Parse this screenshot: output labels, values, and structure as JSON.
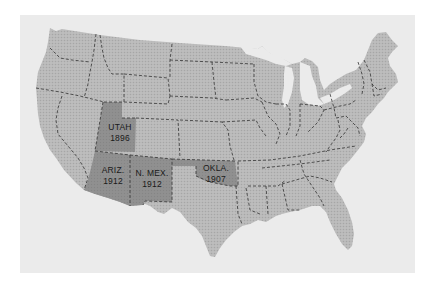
{
  "map": {
    "title": "Statehood dates of the last contiguous western states",
    "colors": {
      "background": "#ffffff",
      "panel": "#ebebeb",
      "land": "#b8b8b8",
      "highlight": "#8e8e8e",
      "border": "#333333",
      "text": "#1a1a1a"
    },
    "highlighted_states": [
      {
        "name": "UTAH",
        "year": "1896"
      },
      {
        "name": "ARIZ.",
        "year": "1912"
      },
      {
        "name": "N. MEX.",
        "year": "1912"
      },
      {
        "name": "OKLA.",
        "year": "1907"
      }
    ]
  }
}
